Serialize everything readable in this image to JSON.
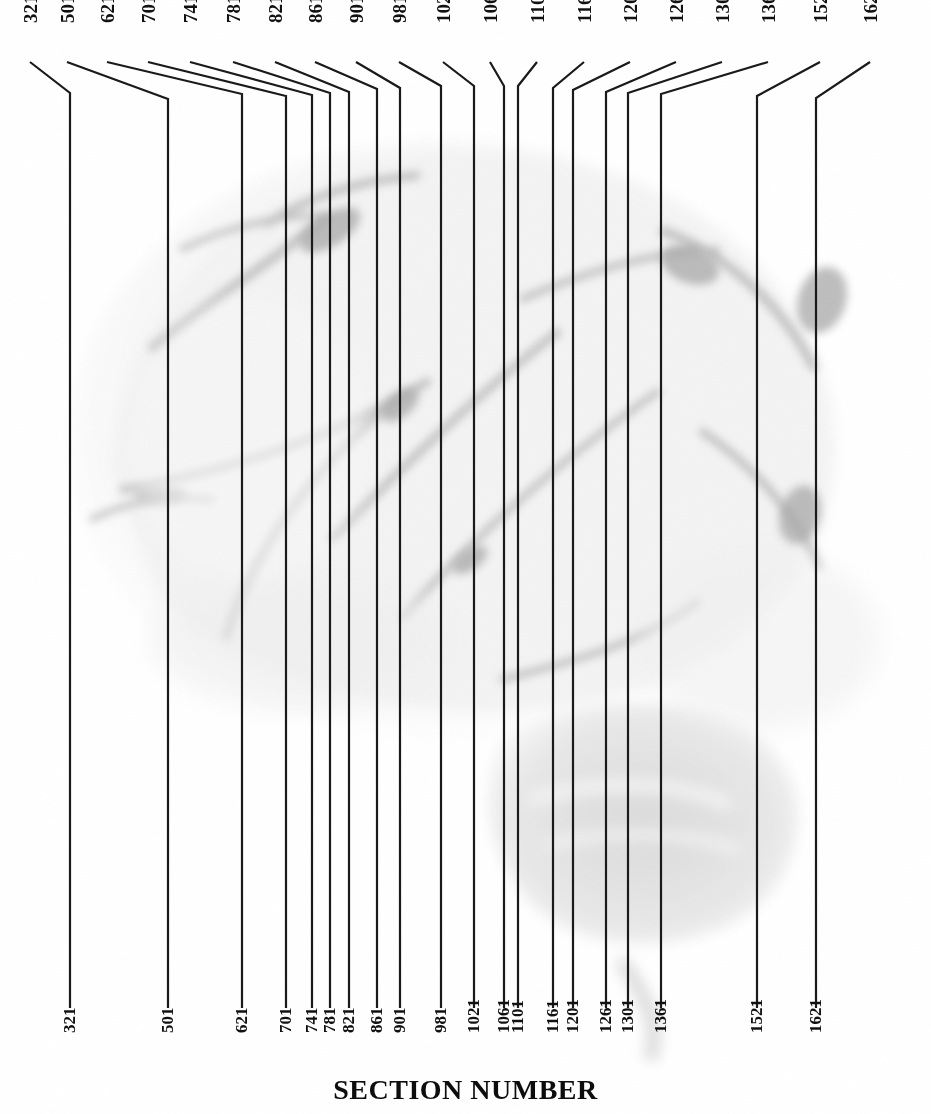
{
  "figure": {
    "axis_title": "SECTION NUMBER",
    "image_description": "sagittal-brain-photograph",
    "line_color": "#1a1a1a",
    "text_color": "#111111",
    "background_color": "#ffffff",
    "width": 931,
    "height": 1114
  },
  "chart_data": {
    "type": "scatter",
    "title": "SECTION NUMBER",
    "xlabel": "SECTION NUMBER",
    "ylabel": "",
    "grid": false,
    "legend": null,
    "annotation": "Vertical lines mark the anterior-posterior level of each numbered histological section across a mid-sagittal brain photograph. Each section number is labelled twice: once at the top via a bent leader line and once at the bottom beneath a short tick.",
    "categories": [
      "321",
      "501",
      "621",
      "701",
      "741",
      "781",
      "821",
      "861",
      "901",
      "981",
      "1021",
      "1061",
      "1101",
      "1161",
      "1201",
      "1261",
      "1301",
      "1361",
      "1521",
      "1621"
    ],
    "values": [
      321,
      501,
      621,
      701,
      741,
      781,
      821,
      861,
      901,
      981,
      1021,
      1061,
      1101,
      1161,
      1201,
      1261,
      1301,
      1361,
      1521,
      1621
    ],
    "xlim": [
      321,
      1621
    ],
    "section_lines": [
      {
        "label": "321",
        "x": 70,
        "top_label_x": 30,
        "elbow_y": 93
      },
      {
        "label": "501",
        "x": 168,
        "top_label_x": 67,
        "elbow_y": 99
      },
      {
        "label": "621",
        "x": 242,
        "top_label_x": 107,
        "elbow_y": 94
      },
      {
        "label": "701",
        "x": 286,
        "top_label_x": 148,
        "elbow_y": 96
      },
      {
        "label": "741",
        "x": 312,
        "top_label_x": 190,
        "elbow_y": 95
      },
      {
        "label": "781",
        "x": 330,
        "top_label_x": 233,
        "elbow_y": 93
      },
      {
        "label": "821",
        "x": 349,
        "top_label_x": 275,
        "elbow_y": 92
      },
      {
        "label": "861",
        "x": 377,
        "top_label_x": 315,
        "elbow_y": 89
      },
      {
        "label": "901",
        "x": 400,
        "top_label_x": 356,
        "elbow_y": 88
      },
      {
        "label": "981",
        "x": 441,
        "top_label_x": 399,
        "elbow_y": 86
      },
      {
        "label": "1021",
        "x": 474,
        "top_label_x": 443,
        "elbow_y": 86
      },
      {
        "label": "1061",
        "x": 504,
        "top_label_x": 490,
        "elbow_y": 86
      },
      {
        "label": "1101",
        "x": 518,
        "top_label_x": 537,
        "elbow_y": 86
      },
      {
        "label": "1161",
        "x": 553,
        "top_label_x": 584,
        "elbow_y": 88
      },
      {
        "label": "1201",
        "x": 573,
        "top_label_x": 630,
        "elbow_y": 90
      },
      {
        "label": "1261",
        "x": 606,
        "top_label_x": 676,
        "elbow_y": 92
      },
      {
        "label": "1301",
        "x": 628,
        "top_label_x": 722,
        "elbow_y": 93
      },
      {
        "label": "1361",
        "x": 661,
        "top_label_x": 768,
        "elbow_y": 94
      },
      {
        "label": "1521",
        "x": 757,
        "top_label_x": 820,
        "elbow_y": 96
      },
      {
        "label": "1621",
        "x": 816,
        "top_label_x": 870,
        "elbow_y": 98
      }
    ],
    "line_geometry": {
      "label_leader_start_y": 62,
      "line_bottom_y": 1008,
      "tick_top_y": 988
    }
  }
}
